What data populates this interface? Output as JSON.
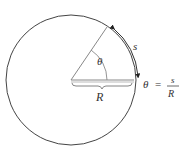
{
  "diagram": {
    "circle": {
      "cx": 71,
      "cy": 80,
      "r": 65,
      "stroke": "#444444"
    },
    "radius_line": {
      "x1": 71,
      "y1": 80,
      "x2": 134,
      "y2": 80,
      "stroke": "#888888"
    },
    "angle_line": {
      "x1": 71,
      "y1": 80,
      "x2": 107,
      "y2": 27,
      "stroke": "#888888"
    },
    "labels": {
      "theta": "θ",
      "arc": "s",
      "radius": "R"
    },
    "formula": {
      "lhs": "θ",
      "equals": "=",
      "numerator": "s",
      "denominator": "R"
    }
  }
}
